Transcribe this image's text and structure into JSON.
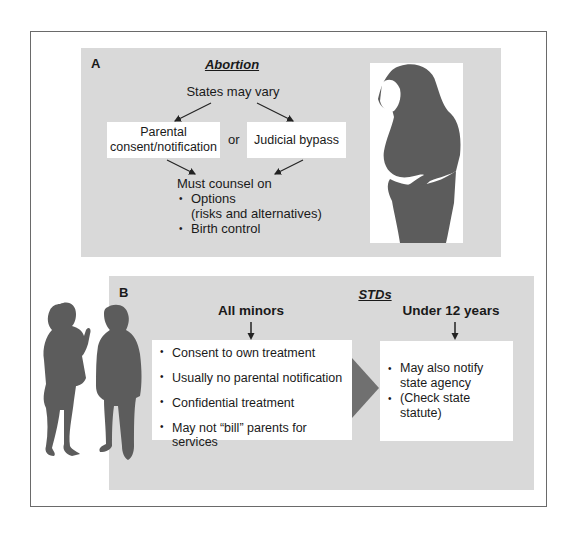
{
  "panel_a": {
    "label": "A",
    "title": "Abortion",
    "top_text": "States may vary",
    "option_left": [
      "Parental",
      "consent/notification"
    ],
    "connector": "or",
    "option_right": "Judicial bypass",
    "counsel_heading": "Must counsel on",
    "counsel_items": [
      {
        "line1": "Options",
        "line2": "(risks and alternatives)"
      },
      {
        "line1": "Birth control"
      }
    ],
    "image": "pregnant-woman-silhouette"
  },
  "panel_b": {
    "label": "B",
    "title": "STDs",
    "col_left_header": "All minors",
    "col_right_header": "Under 12 years",
    "left_items": [
      "Consent to own treatment",
      "Usually no parental notification",
      "Confidential treatment",
      "May not “bill” parents for services"
    ],
    "right_items": [
      {
        "line1": "May also notify",
        "line2": "state agency"
      },
      {
        "line1": "(Check state statute)"
      }
    ],
    "image": "couple-talking-silhouette"
  },
  "colors": {
    "panel_bg": "#d9d9d9",
    "silhouette": "#5c5c5c",
    "arrow": "#7a7a7a",
    "frame_border": "#6a6a6a"
  }
}
